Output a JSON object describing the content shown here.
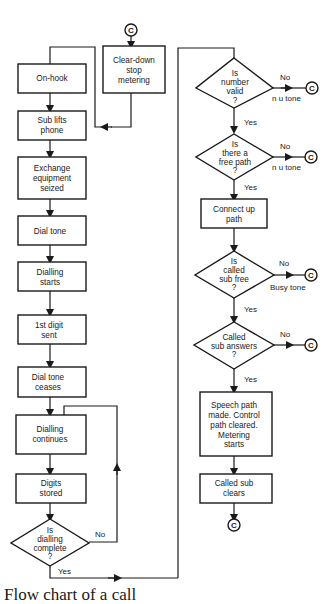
{
  "diagram": {
    "type": "flowchart",
    "caption": "Flow chart of a call",
    "connector_label": "C",
    "left_column": {
      "entry_connector": "C",
      "clear_down": [
        "Clear-down",
        "stop",
        "metering"
      ],
      "steps": [
        {
          "id": "on-hook",
          "lines": [
            "On-hook"
          ]
        },
        {
          "id": "sub-lifts-phone",
          "lines": [
            "Sub lifts",
            "phone"
          ]
        },
        {
          "id": "exchange-equipment-seized",
          "lines": [
            "Exchange",
            "equipment",
            "seized"
          ]
        },
        {
          "id": "dial-tone",
          "lines": [
            "Dial tone"
          ]
        },
        {
          "id": "dialling-starts",
          "lines": [
            "Dialling",
            "starts"
          ]
        },
        {
          "id": "first-digit-sent",
          "lines": [
            "1st digit",
            "sent"
          ]
        },
        {
          "id": "dial-tone-ceases",
          "lines": [
            "Dial tone",
            "ceases"
          ]
        },
        {
          "id": "dialling-continues",
          "lines": [
            "Dialling",
            "continues"
          ]
        },
        {
          "id": "digits-stored",
          "lines": [
            "Digits",
            "stored"
          ]
        }
      ],
      "decision": {
        "id": "is-dialling-complete",
        "lines": [
          "Is",
          "dialling",
          "complete",
          "?"
        ],
        "no": "No",
        "yes": "Yes"
      }
    },
    "right_column": {
      "decisions": [
        {
          "id": "is-number-valid",
          "lines": [
            "Is",
            "number",
            "valid",
            "?"
          ],
          "no": "No",
          "no_note": "n u tone",
          "yes": "Yes"
        },
        {
          "id": "is-there-free-path",
          "lines": [
            "Is",
            "there a",
            "free path",
            "?"
          ],
          "no": "No",
          "no_note": "n u tone",
          "yes": "Yes"
        },
        {
          "id": "is-called-sub-free",
          "lines": [
            "Is",
            "called",
            "sub free",
            "?"
          ],
          "no": "No",
          "no_note": "Busy tone",
          "yes": "Yes"
        },
        {
          "id": "called-sub-answers",
          "lines": [
            "Called",
            "sub answers",
            "?"
          ],
          "no": "No",
          "no_note": "",
          "yes": "Yes"
        }
      ],
      "connect_up_path": [
        "Connect up",
        "path"
      ],
      "speech_path": [
        "Speech path",
        "made. Control",
        "path cleared.",
        "Metering",
        "starts"
      ],
      "called_sub_clears": [
        "Called sub",
        "clears"
      ]
    }
  }
}
